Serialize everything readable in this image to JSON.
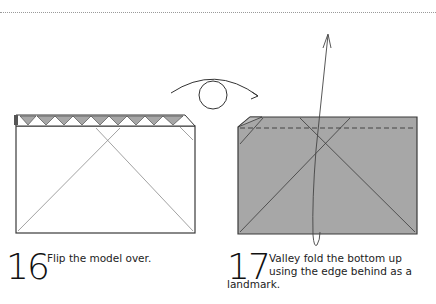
{
  "page": {
    "type": "origami instruction diagram",
    "colors": {
      "paper_white": "#ffffff",
      "paper_gray": "#a7a7a7",
      "outline": "#3a3a3a",
      "crease": "#8a8a8a"
    }
  },
  "steps": [
    {
      "number": "16",
      "instruction": "Flip the model over.",
      "symbols": [
        "flip-over-arrow"
      ]
    },
    {
      "number": "17",
      "instruction_line1": "Valley fold the bottom up",
      "instruction_line2": "using the edge behind as a",
      "instruction_line3": "landmark.",
      "symbols": [
        "valley-fold-arrow",
        "valley-fold-dashed-line"
      ]
    }
  ]
}
